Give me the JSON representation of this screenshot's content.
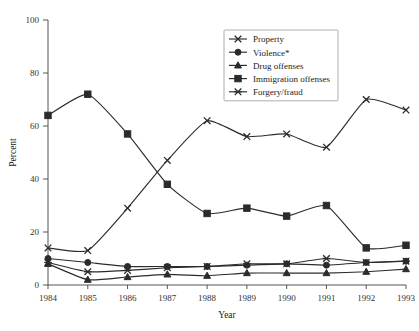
{
  "chart_data": {
    "type": "line",
    "title": "",
    "xlabel": "Year",
    "ylabel": "Percent",
    "categories": [
      1984,
      1985,
      1986,
      1987,
      1988,
      1989,
      1990,
      1991,
      1992,
      1993
    ],
    "xticklabels": [
      "1984",
      "1985",
      "1986",
      "1987",
      "1988",
      "1989",
      "1990",
      "1991",
      "1992",
      "1993"
    ],
    "yticklabels": [
      "0",
      "20",
      "40",
      "60",
      "80",
      "100"
    ],
    "yticks": [
      0,
      20,
      40,
      60,
      80,
      100
    ],
    "ylim": [
      0,
      100
    ],
    "xlim": [
      1984,
      1993
    ],
    "grid": false,
    "legend_position": "upper-center-right",
    "series": [
      {
        "name": "Property",
        "marker": "x",
        "values": [
          14,
          13,
          29,
          47,
          62,
          56,
          57,
          52,
          70,
          66
        ]
      },
      {
        "name": "Violence*",
        "marker": "circle",
        "values": [
          10,
          8.5,
          7,
          7,
          7,
          7.5,
          8,
          7.5,
          8.5,
          9
        ]
      },
      {
        "name": "Drug offenses",
        "marker": "triangle",
        "values": [
          8,
          2,
          3,
          4,
          3.5,
          4.5,
          4.5,
          4.5,
          5,
          6
        ]
      },
      {
        "name": "Immigration offenses",
        "marker": "square",
        "values": [
          64,
          72,
          57,
          38,
          27,
          29,
          26,
          30,
          14,
          15
        ]
      },
      {
        "name": "Forgery/fraud",
        "marker": "star",
        "values": [
          8.5,
          5,
          5.5,
          6.5,
          7,
          8,
          8,
          10,
          8.5,
          9
        ]
      }
    ]
  },
  "legend": {
    "items": [
      {
        "label": "Property"
      },
      {
        "label": "Violence*"
      },
      {
        "label": "Drug offenses"
      },
      {
        "label": "Immigration offenses"
      },
      {
        "label": "Forgery/fraud"
      }
    ]
  },
  "colors": {
    "ink": "#2b2b2b",
    "axis": "#555555",
    "background": "#ffffff"
  }
}
